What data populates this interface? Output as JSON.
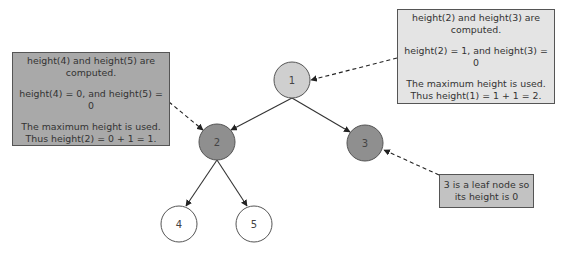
{
  "nodes": [
    {
      "id": "1",
      "label": "1",
      "cx": 292,
      "cy": 80,
      "fill": "#cfcfcf"
    },
    {
      "id": "2",
      "label": "2",
      "cx": 217,
      "cy": 142,
      "fill": "#8f8f8f"
    },
    {
      "id": "3",
      "label": "3",
      "cx": 365,
      "cy": 143,
      "fill": "#8f8f8f"
    },
    {
      "id": "4",
      "label": "4",
      "cx": 179,
      "cy": 224,
      "fill": "#ffffff"
    },
    {
      "id": "5",
      "label": "5",
      "cx": 254,
      "cy": 224,
      "fill": "#ffffff"
    }
  ],
  "edges": [
    {
      "from": "1",
      "to": "2"
    },
    {
      "from": "1",
      "to": "3"
    },
    {
      "from": "2",
      "to": "4"
    },
    {
      "from": "2",
      "to": "5"
    }
  ],
  "notes": {
    "right": {
      "line1": "height(2) and height(3) are",
      "line2": "computed.",
      "line3": "height(2) = 1, and height(3) = 0",
      "line4": "The maximum height is used.",
      "line5": "Thus height(1) = 1 + 1 = 2."
    },
    "left": {
      "line1": "height(4) and height(5) are",
      "line2": "computed.",
      "line3": "height(4) = 0, and height(5) = 0",
      "line4": "The maximum height is used.",
      "line5": "Thus height(2) = 0 + 1 = 1."
    },
    "leaf": {
      "line1": "3 is a leaf node so",
      "line2": "its height is 0"
    }
  },
  "colors": {
    "edge": "#333333",
    "node_border": "#555555",
    "note_border": "#555555"
  }
}
